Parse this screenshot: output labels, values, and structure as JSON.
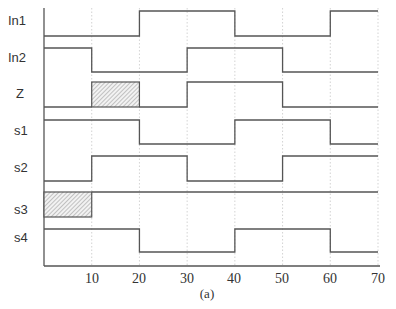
{
  "diagram": {
    "type": "timing-diagram",
    "caption": "(a)",
    "colors": {
      "line": "#555555",
      "grid": "#c8c8c8",
      "hatch": "#999999",
      "text": "#333333"
    },
    "time_axis": {
      "min": 0,
      "max": 70,
      "ticks": [
        "10",
        "20",
        "30",
        "40",
        "50",
        "60",
        "70"
      ],
      "tick_values": [
        10,
        20,
        30,
        40,
        50,
        60,
        70
      ]
    },
    "signals": [
      {
        "name": "In1",
        "segments": [
          [
            0,
            20,
            "0"
          ],
          [
            20,
            40,
            "1"
          ],
          [
            40,
            60,
            "0"
          ],
          [
            60,
            70,
            "1"
          ]
        ]
      },
      {
        "name": "In2",
        "segments": [
          [
            0,
            10,
            "1"
          ],
          [
            10,
            30,
            "0"
          ],
          [
            30,
            50,
            "1"
          ],
          [
            50,
            70,
            "0"
          ]
        ]
      },
      {
        "name": "Z",
        "segments": [
          [
            0,
            10,
            "0"
          ],
          [
            10,
            20,
            "X"
          ],
          [
            20,
            30,
            "0"
          ],
          [
            30,
            50,
            "1"
          ],
          [
            50,
            70,
            "0"
          ]
        ]
      },
      {
        "name": "s1",
        "segments": [
          [
            0,
            20,
            "1"
          ],
          [
            20,
            40,
            "0"
          ],
          [
            40,
            60,
            "1"
          ],
          [
            60,
            70,
            "0"
          ]
        ]
      },
      {
        "name": "s2",
        "segments": [
          [
            0,
            10,
            "0"
          ],
          [
            10,
            30,
            "1"
          ],
          [
            30,
            50,
            "0"
          ],
          [
            50,
            70,
            "1"
          ]
        ]
      },
      {
        "name": "s3",
        "segments": [
          [
            0,
            10,
            "X"
          ],
          [
            10,
            70,
            "1"
          ]
        ]
      },
      {
        "name": "s4",
        "segments": [
          [
            0,
            20,
            "1"
          ],
          [
            20,
            40,
            "0"
          ],
          [
            40,
            60,
            "1"
          ],
          [
            60,
            70,
            "0"
          ]
        ]
      }
    ]
  }
}
